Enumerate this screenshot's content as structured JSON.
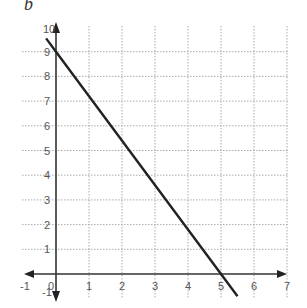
{
  "figure_label": "b",
  "chart_data": {
    "type": "line",
    "title": "",
    "xlabel": "",
    "ylabel": "",
    "xlim": [
      -1,
      7
    ],
    "ylim": [
      -1,
      10
    ],
    "grid": true,
    "x_ticks": [
      "-1",
      "0",
      "1",
      "2",
      "3",
      "4",
      "5",
      "6",
      "7"
    ],
    "y_ticks": [
      "-1",
      "1",
      "2",
      "3",
      "4",
      "5",
      "6",
      "7",
      "8",
      "9",
      "10"
    ],
    "series": [
      {
        "name": "line",
        "x": [
          -0.3,
          0,
          5,
          5.5
        ],
        "y": [
          9.54,
          9,
          0,
          -0.9
        ],
        "equation": "y = -1.8x + 9",
        "y_intercept": 9,
        "x_intercept": 5
      }
    ]
  }
}
